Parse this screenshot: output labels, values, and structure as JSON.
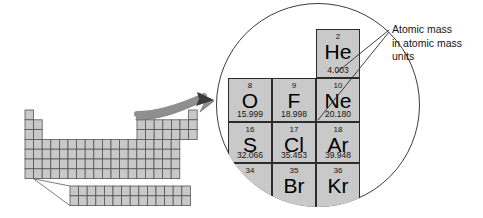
{
  "figure": {
    "colors": {
      "cell_fill": "#c9c9c9",
      "cell_stroke": "#2b2b2b",
      "circle_stroke": "#3c3c3c",
      "arrow_fill": "#8c8c8c",
      "text": "#141414",
      "background": "#ffffff"
    }
  },
  "annotation": {
    "name": "atomic-mass-callout",
    "lines": [
      "Atomic mass",
      "in atomic mass",
      "units"
    ],
    "leader_targets": [
      "4.003",
      "20.180"
    ]
  },
  "magnifier": {
    "name": "magnifier-circle",
    "shape": "circle",
    "cells": [
      {
        "number": "2",
        "symbol": "He",
        "mass": "4.003",
        "col": 3,
        "row": 1,
        "clipped": false
      },
      {
        "number": "8",
        "symbol": "O",
        "mass": "15.999",
        "col": 1,
        "row": 2,
        "clipped": false
      },
      {
        "number": "9",
        "symbol": "F",
        "mass": "18.998",
        "col": 2,
        "row": 2,
        "clipped": false
      },
      {
        "number": "10",
        "symbol": "Ne",
        "mass": "20.180",
        "col": 3,
        "row": 2,
        "clipped": false
      },
      {
        "number": "16",
        "symbol": "S",
        "mass": "32.066",
        "col": 1,
        "row": 3,
        "clipped": false
      },
      {
        "number": "17",
        "symbol": "Cl",
        "mass": "35.453",
        "col": 2,
        "row": 3,
        "clipped": false
      },
      {
        "number": "18",
        "symbol": "Ar",
        "mass": "39.948",
        "col": 3,
        "row": 3,
        "clipped": false
      },
      {
        "number": "34",
        "symbol": "",
        "mass": "",
        "col": 1,
        "row": 4,
        "clipped": true
      },
      {
        "number": "35",
        "symbol": "Br",
        "mass": "",
        "col": 2,
        "row": 4,
        "clipped": true
      },
      {
        "number": "36",
        "symbol": "Kr",
        "mass": "",
        "col": 3,
        "row": 4,
        "clipped": true
      }
    ]
  },
  "mini_table": {
    "name": "periodic-table-thumbnail",
    "description": "Unlabeled schematic periodic table grid",
    "main_rows": 7,
    "main_cols": 18,
    "inner_block_rows": 2,
    "inner_block_cols": 14,
    "highlight_note": "grey filled cells, no element text"
  }
}
